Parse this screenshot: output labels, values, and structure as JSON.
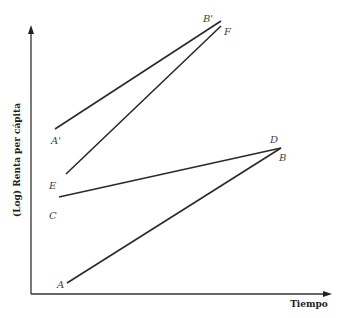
{
  "chart_data": {
    "type": "line",
    "title": "",
    "xlabel": "Tiempo",
    "ylabel": "(Log) Renta per cápita",
    "grid": false,
    "legend": null,
    "series": [
      {
        "name": "A-B",
        "start_label": "A",
        "end_label": "B",
        "start": [
          67,
          283
        ],
        "end": [
          281,
          148
        ]
      },
      {
        "name": "C-D",
        "start_label": "C",
        "end_label": "D",
        "start": [
          59,
          197
        ],
        "end": [
          281,
          148
        ]
      },
      {
        "name": "E-F",
        "start_label": "E",
        "end_label": "F",
        "start": [
          66,
          174
        ],
        "end": [
          221,
          26
        ]
      },
      {
        "name": "A'-B'",
        "start_label": "A'",
        "end_label": "B'",
        "start": [
          55,
          129
        ],
        "end": [
          221,
          21
        ]
      }
    ],
    "point_labels": [
      {
        "text": "A",
        "x": 57,
        "y": 288
      },
      {
        "text": "C",
        "x": 49,
        "y": 219
      },
      {
        "text": "E",
        "x": 49,
        "y": 189
      },
      {
        "text": "A'",
        "x": 51,
        "y": 144
      },
      {
        "text": "D",
        "x": 270,
        "y": 143
      },
      {
        "text": "B",
        "x": 279,
        "y": 161
      },
      {
        "text": "B'",
        "x": 203,
        "y": 22
      },
      {
        "text": "F",
        "x": 224,
        "y": 35
      }
    ]
  }
}
